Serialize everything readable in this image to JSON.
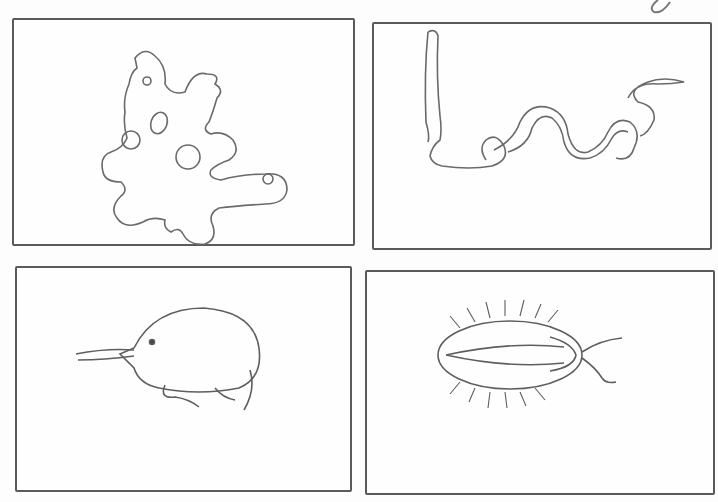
{
  "image": {
    "style": "pencil sketch",
    "background": "#fdfdfd",
    "line_color": "#5a5a5a",
    "panels": [
      {
        "id": "top-left",
        "subject": "amoeba"
      },
      {
        "id": "top-right",
        "subject": "worm"
      },
      {
        "id": "bottom-left",
        "subject": "ostracod"
      },
      {
        "id": "bottom-right",
        "subject": "trilobite-like arthropod"
      }
    ]
  }
}
